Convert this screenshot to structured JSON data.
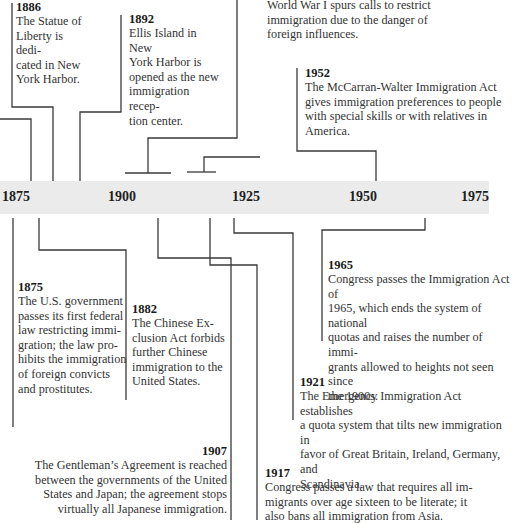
{
  "timeline": {
    "axis_labels": [
      "1875",
      "1900",
      "1925",
      "1950",
      "1975"
    ],
    "band_color": "#ebebeb",
    "line_color": "#3a3a3a"
  },
  "events_above": [
    {
      "year": "1886",
      "text": "The Statue of Liberty is dedi-cated in New York Harbor.",
      "lines": [
        "The Statue of",
        "Liberty is dedi-",
        "cated in New",
        "York Harbor."
      ]
    },
    {
      "year": "1892",
      "text": "Ellis Island in New York Harbor is opened as the new immigration recep-tion center.",
      "lines": [
        "Ellis Island in New",
        "York Harbor is",
        "opened as the new",
        "immigration recep-",
        "tion center."
      ]
    },
    {
      "year": "",
      "text": "World War I spurs calls to restrict immigration due to the danger of foreign influences.",
      "lines": [
        "World War I spurs calls to restrict",
        "immigration due to the danger of",
        "foreign influences."
      ]
    },
    {
      "year": "1952",
      "text": "The McCarran-Walter Immigration Act gives immigration preferences to people with special skills or with relatives in America.",
      "lines": [
        "The McCarran-Walter Immigration Act",
        "gives immigration preferences to people",
        "with special skills or with relatives in",
        "America."
      ]
    }
  ],
  "events_below": [
    {
      "year": "1875",
      "lines": [
        "The U.S. government",
        "passes its first federal",
        "law restricting immi-",
        "gration; the law pro-",
        "hibits the immigration",
        "of foreign convicts",
        "and prostitutes."
      ]
    },
    {
      "year": "1882",
      "lines": [
        "The Chinese Ex-",
        "clusion Act forbids",
        "further Chinese",
        "immigration to the",
        "United States."
      ]
    },
    {
      "year": "1907",
      "lines": [
        "The Gentleman’s Agreement is reached",
        "between the governments of the United",
        "States and Japan; the agreement stops",
        "virtually all Japanese immigration."
      ]
    },
    {
      "year": "1965",
      "lines": [
        "Congress passes the Immigration Act of",
        "1965, which ends the system of national",
        "quotas and raises the number of immi-",
        "grants allowed to heights not seen since",
        "the 1900s."
      ]
    },
    {
      "year": "1921",
      "lines": [
        "The Emergency Immigration Act establishes",
        "a quota system that tilts new immigration in",
        "favor of Great Britain, Ireland, Germany, and",
        "Scandinavia."
      ]
    },
    {
      "year": "1917",
      "lines": [
        "Congress passes a law that requires all im-",
        "migrants over age sixteen to be literate; it",
        "also bans all immigration from Asia."
      ]
    }
  ]
}
